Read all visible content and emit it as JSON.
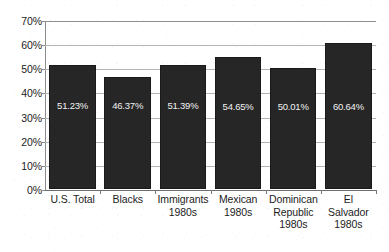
{
  "chart_data": {
    "type": "bar",
    "title": "",
    "subtitle": "",
    "xlabel": "",
    "ylabel": "",
    "ylim": [
      0,
      70
    ],
    "ytick_labels": [
      "70%",
      "60%",
      "50%",
      "40%",
      "30%",
      "20%",
      "10%",
      "0%"
    ],
    "ytick_values": [
      70,
      60,
      50,
      40,
      30,
      20,
      10,
      0
    ],
    "grid": true,
    "legend": false,
    "legend_position": "none",
    "categories": [
      "U.S. Total",
      "Blacks",
      "Immigrants 1980s",
      "Mexican 1980s",
      "Dominican Republic 1980s",
      "El Salvador 1980s"
    ],
    "category_lines": [
      [
        "U.S. Total"
      ],
      [
        "Blacks"
      ],
      [
        "Immigrants",
        "1980s"
      ],
      [
        "Mexican",
        "1980s"
      ],
      [
        "Dominican",
        "Republic",
        "1980s"
      ],
      [
        "El",
        "Salvador",
        "1980s"
      ]
    ],
    "values": [
      51.23,
      46.37,
      51.39,
      54.65,
      50.01,
      60.64
    ],
    "value_labels": [
      "51.23%",
      "46.37%",
      "51.39%",
      "54.65%",
      "50.01%",
      "60.64%"
    ],
    "series": [
      {
        "name": "",
        "values": [
          51.23,
          46.37,
          51.39,
          54.65,
          50.01,
          60.64
        ]
      }
    ],
    "colors": {
      "bar_fill": "#262626",
      "bar_edge": "#1a1a1a",
      "gridline": "#b4b4b4",
      "axis": "#8c8c8c",
      "background": "#ffffff",
      "value_label": "#f2f2f2",
      "tick_label": "#1c1c1c"
    }
  }
}
